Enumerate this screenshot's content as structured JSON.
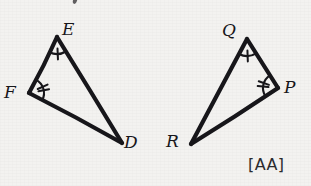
{
  "figure": {
    "background_color": "#f3f2f0",
    "stroke_color": "#17161a",
    "stroke_width": 4.2,
    "postulate": "[AA]",
    "triangles": [
      {
        "name": "triangle-def",
        "vertices": [
          {
            "id": "F",
            "label": "F",
            "x": 29,
            "y": 93,
            "label_x": 4,
            "label_y": 84
          },
          {
            "id": "E",
            "label": "E",
            "x": 57,
            "y": 37,
            "label_x": 62,
            "label_y": 21
          },
          {
            "id": "D",
            "label": "D",
            "x": 122,
            "y": 143,
            "label_x": 124,
            "label_y": 134
          }
        ],
        "angle_marks": [
          {
            "vertex": "E",
            "ticks": 1,
            "radius": 17
          },
          {
            "vertex": "F",
            "ticks": 2,
            "radius": 15
          }
        ]
      },
      {
        "name": "triangle-pqr",
        "vertices": [
          {
            "id": "Q",
            "label": "Q",
            "x": 247,
            "y": 39,
            "label_x": 222,
            "label_y": 22
          },
          {
            "id": "P",
            "label": "P",
            "x": 278,
            "y": 88,
            "label_x": 284,
            "label_y": 79
          },
          {
            "id": "R",
            "label": "R",
            "x": 191,
            "y": 144,
            "label_x": 166,
            "label_y": 133
          }
        ],
        "angle_marks": [
          {
            "vertex": "Q",
            "ticks": 1,
            "radius": 17
          },
          {
            "vertex": "P",
            "ticks": 2,
            "radius": 15
          }
        ]
      }
    ],
    "postulate_label": {
      "text": "[AA]",
      "x": 248,
      "y": 157
    }
  }
}
